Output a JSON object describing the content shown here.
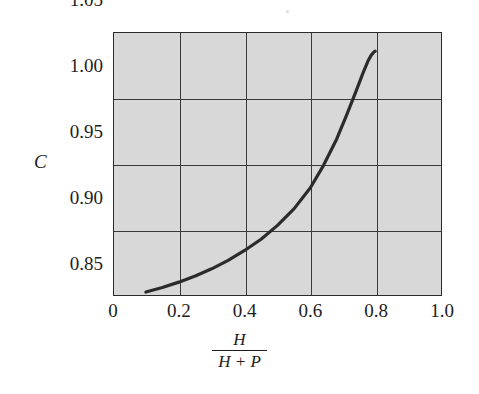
{
  "chart_data": {
    "type": "line",
    "title": "",
    "subtitle": "",
    "xlabel_numerator": "H",
    "xlabel_denominator": "H + P",
    "xlabel": "H/(H + P)",
    "ylabel": "C",
    "xlim": [
      0,
      1.0
    ],
    "ylim": [
      0.85,
      1.05
    ],
    "xticks": [
      0,
      0.2,
      0.4,
      0.6,
      0.8,
      1.0
    ],
    "xtick_labels": [
      "0",
      "0.2",
      "0.4",
      "0.6",
      "0.8",
      "1.0"
    ],
    "yticks": [
      0.85,
      0.9,
      0.95,
      1.0,
      1.05
    ],
    "ytick_labels": [
      "0.85",
      "0.90",
      "0.95",
      "1.00",
      "1.05"
    ],
    "grid": true,
    "grid_x_values": [
      0.2,
      0.4,
      0.6,
      0.8
    ],
    "grid_y_values": [
      0.9,
      0.95,
      1.0
    ],
    "legend": null,
    "plot_bgcolor": "#d8d8d8",
    "line_color": "#2b2b2b",
    "line_width": 3.2,
    "series": [
      {
        "name": "C",
        "x": [
          0.1,
          0.15,
          0.2,
          0.25,
          0.3,
          0.35,
          0.4,
          0.45,
          0.5,
          0.55,
          0.6,
          0.64,
          0.68,
          0.71,
          0.74,
          0.76,
          0.775,
          0.785,
          0.793,
          0.797
        ],
        "y": [
          0.853,
          0.8565,
          0.8605,
          0.8652,
          0.8706,
          0.877,
          0.8845,
          0.893,
          0.9035,
          0.916,
          0.932,
          0.949,
          0.969,
          0.987,
          1.006,
          1.019,
          1.028,
          1.0325,
          1.0348,
          1.0355
        ]
      }
    ],
    "annotations": []
  },
  "axis": {
    "y_title": "C",
    "x_title_numerator": "H",
    "x_title_denominator": "H + P"
  }
}
